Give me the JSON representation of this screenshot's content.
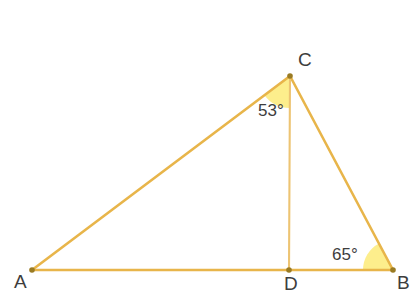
{
  "figure": {
    "kind": "geometry-diagram",
    "shape": "triangle-with-altitude",
    "width": 419,
    "height": 294,
    "background_color": "#ffffff"
  },
  "style": {
    "line_color": "#e8b54a",
    "line_color_inner": "#edc473",
    "wedge_fill": "#fdee8c",
    "vertex_dot_color": "#9a7b23",
    "label_color": "#3d3d3d",
    "line_width": 2.6,
    "inner_line_width": 2.1,
    "vertex_dot_radius": 2.8
  },
  "points": {
    "A": {
      "label": "A",
      "x": 32,
      "y": 270,
      "label_x": 14,
      "label_y": 288
    },
    "B": {
      "label": "B",
      "x": 393,
      "y": 270,
      "label_x": 397,
      "label_y": 289
    },
    "C": {
      "label": "C",
      "x": 290,
      "y": 76,
      "label_x": 298,
      "label_y": 66
    },
    "D": {
      "label": "D",
      "x": 289,
      "y": 270,
      "label_x": 284,
      "label_y": 290
    }
  },
  "segments": [
    {
      "name": "segment-AB",
      "from": "A",
      "to": "B"
    },
    {
      "name": "segment-AC",
      "from": "A",
      "to": "C"
    },
    {
      "name": "segment-CB",
      "from": "C",
      "to": "B"
    },
    {
      "name": "segment-CD",
      "from": "C",
      "to": "D"
    }
  ],
  "angles": [
    {
      "name": "angle-ACD",
      "value": "53°",
      "degrees": 53,
      "vertex": "C",
      "between": [
        "A",
        "D"
      ],
      "label_x": 258,
      "label_y": 116,
      "wedge_radius": 32
    },
    {
      "name": "angle-DBC",
      "value": "65°",
      "degrees": 65,
      "vertex": "B",
      "between": [
        "D",
        "C"
      ],
      "label_x": 332,
      "label_y": 260,
      "wedge_radius": 30
    }
  ],
  "wedge_paths": {
    "at_C": "M 290 76 L 265.9 97.2 A 32 32 0 0 1 290 108 Z",
    "at_B": "M 393 270 L 363 270 A 30 30 0 0 1 380.3 242.8 Z"
  }
}
